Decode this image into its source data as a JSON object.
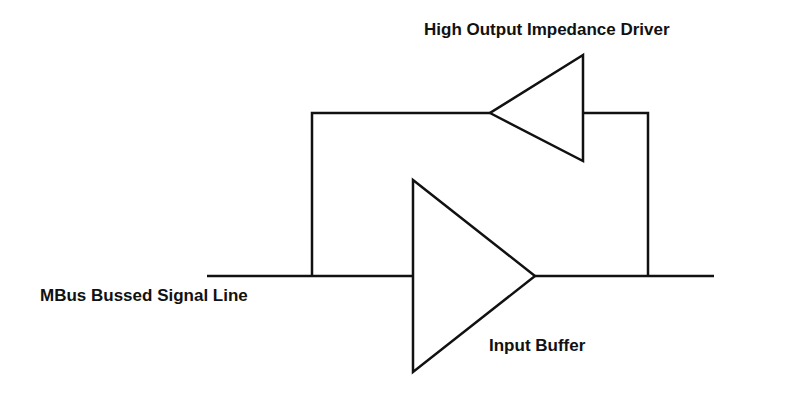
{
  "labels": {
    "driver": "High Output Impedance Driver",
    "bus": "MBus Bussed Signal Line",
    "buffer": "Input Buffer"
  },
  "colors": {
    "line": "#111111",
    "background": "#ffffff"
  },
  "components": [
    {
      "name": "High Output Impedance Driver",
      "type": "buffer-triangle",
      "direction": "left"
    },
    {
      "name": "Input Buffer",
      "type": "buffer-triangle",
      "direction": "right"
    }
  ]
}
